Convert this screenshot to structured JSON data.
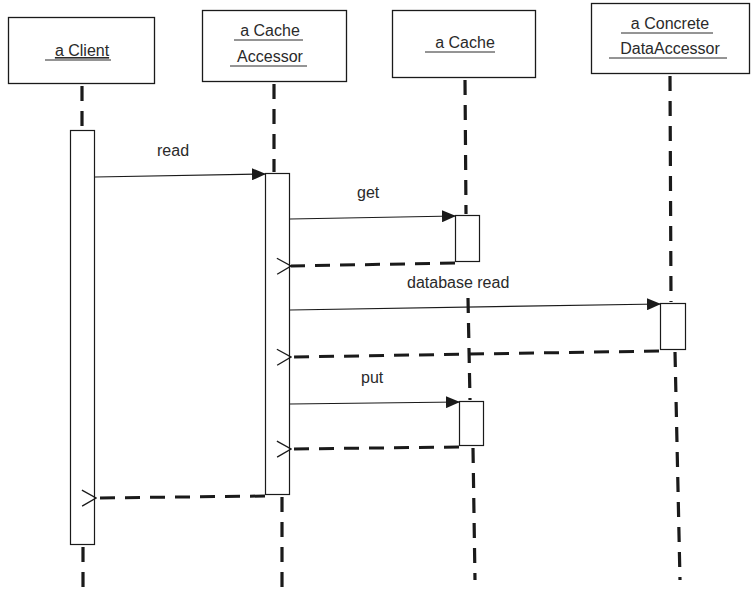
{
  "diagram": {
    "type": "UML sequence diagram",
    "colors": {
      "line": "#1a1a1a",
      "box_fill": "#ffffff",
      "text": "#2a2a2a"
    },
    "objects": [
      {
        "id": "client",
        "lines": [
          "a Client"
        ]
      },
      {
        "id": "cache_accessor",
        "lines": [
          "a Cache",
          "Accessor"
        ]
      },
      {
        "id": "cache",
        "lines": [
          "a Cache"
        ]
      },
      {
        "id": "data_accessor",
        "lines": [
          "a Concrete",
          "DataAccessor"
        ]
      }
    ],
    "messages": [
      {
        "from": "client",
        "to": "cache_accessor",
        "label": "read",
        "kind": "call"
      },
      {
        "from": "cache_accessor",
        "to": "cache",
        "label": "get",
        "kind": "call"
      },
      {
        "from": "cache",
        "to": "cache_accessor",
        "label": "",
        "kind": "return"
      },
      {
        "from": "cache_accessor",
        "to": "data_accessor",
        "label": "database read",
        "kind": "call"
      },
      {
        "from": "data_accessor",
        "to": "cache_accessor",
        "label": "",
        "kind": "return"
      },
      {
        "from": "cache_accessor",
        "to": "cache",
        "label": "put",
        "kind": "call"
      },
      {
        "from": "cache",
        "to": "cache_accessor",
        "label": "",
        "kind": "return"
      },
      {
        "from": "cache_accessor",
        "to": "client",
        "label": "",
        "kind": "return"
      }
    ]
  }
}
